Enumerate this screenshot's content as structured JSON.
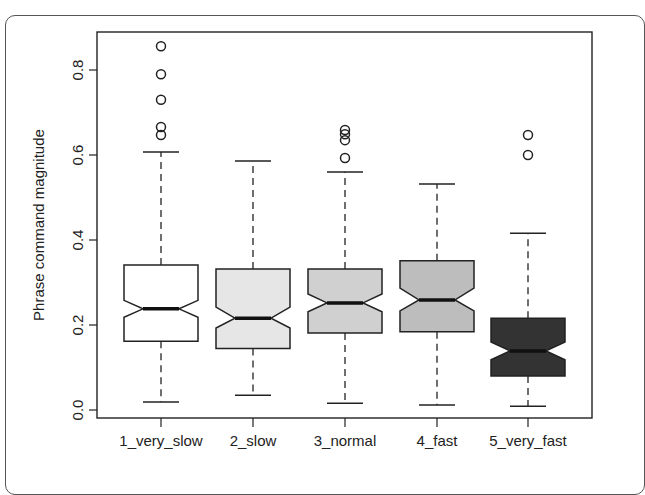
{
  "chart_data": {
    "type": "boxplot",
    "notched": true,
    "title": "",
    "xlabel": "",
    "ylabel": "Phrase command magnitude",
    "ylim": [
      -0.02,
      0.88
    ],
    "yticks": [
      0.0,
      0.2,
      0.4,
      0.6,
      0.8
    ],
    "ytick_labels": [
      "0.0",
      "0.2",
      "0.4",
      "0.6",
      "0.8"
    ],
    "categories": [
      "1_very_slow",
      "2_slow",
      "3_normal",
      "4_fast",
      "5_very_fast"
    ],
    "grid": false,
    "legend": null,
    "series": [
      {
        "name": "1_very_slow",
        "fill": "#ffffff",
        "whisker_low": 0.019,
        "q1": 0.162,
        "median": 0.238,
        "q3": 0.341,
        "whisker_high": 0.607,
        "notch_low": 0.218,
        "notch_high": 0.258,
        "outliers": [
          0.647,
          0.666,
          0.73,
          0.79,
          0.856
        ]
      },
      {
        "name": "2_slow",
        "fill": "#e6e6e6",
        "whisker_low": 0.035,
        "q1": 0.145,
        "median": 0.216,
        "q3": 0.332,
        "whisker_high": 0.586,
        "notch_low": 0.193,
        "notch_high": 0.242,
        "outliers": []
      },
      {
        "name": "3_normal",
        "fill": "#d0d0d0",
        "whisker_low": 0.016,
        "q1": 0.181,
        "median": 0.252,
        "q3": 0.332,
        "whisker_high": 0.56,
        "notch_low": 0.231,
        "notch_high": 0.273,
        "outliers": [
          0.593,
          0.635,
          0.649,
          0.659
        ]
      },
      {
        "name": "4_fast",
        "fill": "#bdbdbd",
        "whisker_low": 0.012,
        "q1": 0.184,
        "median": 0.259,
        "q3": 0.351,
        "whisker_high": 0.532,
        "notch_low": 0.233,
        "notch_high": 0.287,
        "outliers": []
      },
      {
        "name": "5_very_fast",
        "fill": "#333333",
        "whisker_low": 0.009,
        "q1": 0.08,
        "median": 0.139,
        "q3": 0.216,
        "whisker_high": 0.416,
        "notch_low": 0.118,
        "notch_high": 0.16,
        "outliers": [
          0.6,
          0.647
        ]
      }
    ]
  }
}
